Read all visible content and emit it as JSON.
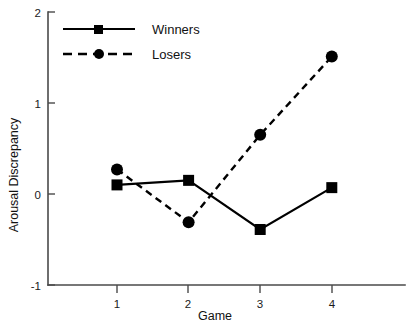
{
  "chart_data": {
    "type": "line",
    "title": "",
    "xlabel": "Game",
    "ylabel": "Arousal Discrepancy",
    "categories": [
      "1",
      "2",
      "3",
      "4"
    ],
    "x": [
      1,
      2,
      3,
      4
    ],
    "xlim": [
      0.45,
      4.45
    ],
    "ylim": [
      -1,
      2
    ],
    "xticks": [
      "1",
      "2",
      "3",
      "4"
    ],
    "yticks": [
      "-1",
      "0",
      "1",
      "2"
    ],
    "ytick_values": [
      -1,
      0,
      1,
      2
    ],
    "grid": false,
    "legend_position": "top-left-inside",
    "series": [
      {
        "name": "Winners",
        "values": [
          0.1,
          0.15,
          -0.39,
          0.07
        ],
        "linestyle": "solid",
        "marker": "square",
        "color": "#000000"
      },
      {
        "name": "Losers",
        "values": [
          0.27,
          -0.31,
          0.65,
          1.51
        ],
        "linestyle": "dashed",
        "marker": "circle",
        "color": "#000000"
      }
    ]
  },
  "legend": {
    "items": [
      {
        "label": "Winners",
        "marker": "square-marker",
        "linestyle": "solid"
      },
      {
        "label": "Losers",
        "marker": "circle-marker",
        "linestyle": "dashed"
      }
    ]
  },
  "axes": {
    "y_axis_label": "Arousal Discrepancy",
    "x_axis_label": "Game"
  }
}
